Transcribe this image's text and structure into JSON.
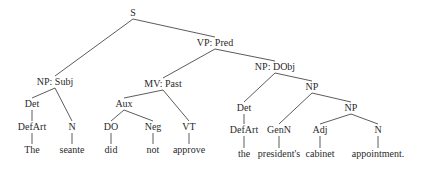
{
  "diagram": {
    "type": "syntax-tree",
    "sentence": "The seante did not approve the president's cabinet appointment.",
    "nodes": [
      {
        "id": "s",
        "label": "S",
        "x": 133,
        "y": 13
      },
      {
        "id": "np-subj",
        "label": "NP: Subj",
        "x": 55,
        "y": 82
      },
      {
        "id": "vp-pred",
        "label": "VP: Pred",
        "x": 215,
        "y": 43
      },
      {
        "id": "det1",
        "label": "Det",
        "x": 32,
        "y": 104
      },
      {
        "id": "defart1",
        "label": "DefArt",
        "x": 32,
        "y": 127
      },
      {
        "id": "the1",
        "label": "The",
        "x": 32,
        "y": 150
      },
      {
        "id": "n1",
        "label": "N",
        "x": 72,
        "y": 127
      },
      {
        "id": "seante",
        "label": "seante",
        "x": 72,
        "y": 150
      },
      {
        "id": "mv-past",
        "label": "MV: Past",
        "x": 163,
        "y": 84
      },
      {
        "id": "aux",
        "label": "Aux",
        "x": 124,
        "y": 104
      },
      {
        "id": "do",
        "label": "DO",
        "x": 111,
        "y": 127
      },
      {
        "id": "did",
        "label": "did",
        "x": 111,
        "y": 150
      },
      {
        "id": "neg",
        "label": "Neg",
        "x": 153,
        "y": 127
      },
      {
        "id": "not",
        "label": "not",
        "x": 153,
        "y": 150
      },
      {
        "id": "vt",
        "label": "VT",
        "x": 189,
        "y": 127
      },
      {
        "id": "approve",
        "label": "approve",
        "x": 189,
        "y": 150
      },
      {
        "id": "np-dobj",
        "label": "NP: DObj",
        "x": 275,
        "y": 67
      },
      {
        "id": "det2",
        "label": "Det",
        "x": 244,
        "y": 108
      },
      {
        "id": "defart2",
        "label": "DefArt",
        "x": 244,
        "y": 130
      },
      {
        "id": "the2",
        "label": "the",
        "x": 244,
        "y": 154
      },
      {
        "id": "np2",
        "label": "NP",
        "x": 312,
        "y": 87
      },
      {
        "id": "genn",
        "label": "GenN",
        "x": 279,
        "y": 130
      },
      {
        "id": "presidents",
        "label": "president's",
        "x": 279,
        "y": 154
      },
      {
        "id": "np3",
        "label": "NP",
        "x": 351,
        "y": 108
      },
      {
        "id": "adj",
        "label": "Adj",
        "x": 320,
        "y": 130
      },
      {
        "id": "cabinet",
        "label": "cabinet",
        "x": 320,
        "y": 154
      },
      {
        "id": "n2",
        "label": "N",
        "x": 378,
        "y": 130
      },
      {
        "id": "appointment",
        "label": "appointment.",
        "x": 378,
        "y": 154
      }
    ],
    "edges": [
      [
        "s",
        "np-subj"
      ],
      [
        "s",
        "vp-pred"
      ],
      [
        "np-subj",
        "det1"
      ],
      [
        "np-subj",
        "n1"
      ],
      [
        "det1",
        "defart1"
      ],
      [
        "defart1",
        "the1"
      ],
      [
        "n1",
        "seante"
      ],
      [
        "vp-pred",
        "mv-past"
      ],
      [
        "vp-pred",
        "np-dobj"
      ],
      [
        "mv-past",
        "aux"
      ],
      [
        "mv-past",
        "vt"
      ],
      [
        "aux",
        "do"
      ],
      [
        "aux",
        "neg"
      ],
      [
        "do",
        "did"
      ],
      [
        "neg",
        "not"
      ],
      [
        "vt",
        "approve"
      ],
      [
        "np-dobj",
        "det2"
      ],
      [
        "np-dobj",
        "np2"
      ],
      [
        "det2",
        "defart2"
      ],
      [
        "defart2",
        "the2"
      ],
      [
        "np2",
        "genn"
      ],
      [
        "np2",
        "np3"
      ],
      [
        "genn",
        "presidents"
      ],
      [
        "np3",
        "adj"
      ],
      [
        "np3",
        "n2"
      ],
      [
        "adj",
        "cabinet"
      ],
      [
        "n2",
        "appointment"
      ]
    ]
  }
}
